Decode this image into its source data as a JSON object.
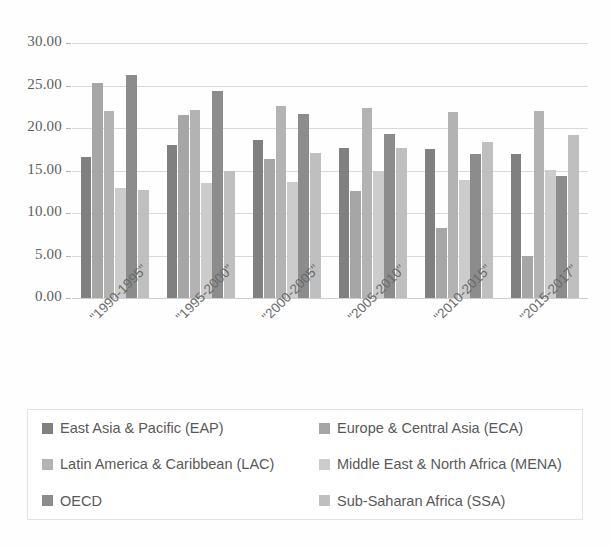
{
  "chart_data": {
    "type": "bar",
    "title": "",
    "subtitle": "",
    "xlabel": "",
    "ylabel": "",
    "ylim": [
      0,
      30
    ],
    "ytick_labels": [
      "0.00",
      "5.00",
      "10.00",
      "15.00",
      "20.00",
      "25.00",
      "30.00"
    ],
    "ytick_values": [
      0,
      5,
      10,
      15,
      20,
      25,
      30
    ],
    "grid": true,
    "legend_position": "bottom",
    "categories": [
      "\"1990-1995\"",
      "\"1995-2000\"",
      "\"2000-2005\"",
      "\"2005-2010\"",
      "\"2010-2015\"",
      "\"2015-2017\""
    ],
    "series": [
      {
        "name": "East Asia & Pacific (EAP)",
        "color": "#808080",
        "values": [
          16.6,
          18.0,
          18.6,
          17.7,
          17.5,
          16.9
        ]
      },
      {
        "name": "Europe & Central Asia (ECA)",
        "color": "#a6a6a6",
        "values": [
          25.3,
          21.5,
          16.3,
          12.6,
          8.2,
          4.9
        ]
      },
      {
        "name": "Latin America & Caribbean (LAC)",
        "color": "#b3b3b3",
        "values": [
          22.0,
          22.1,
          22.6,
          22.3,
          21.9,
          22.0
        ]
      },
      {
        "name": "Middle East & North Africa (MENA)",
        "color": "#cccccc",
        "values": [
          12.9,
          13.5,
          13.6,
          14.9,
          13.9,
          15.1
        ]
      },
      {
        "name": "OECD",
        "color": "#8c8c8c",
        "values": [
          26.2,
          24.4,
          21.6,
          19.3,
          16.9,
          14.4
        ]
      },
      {
        "name": "Sub-Saharan Africa (SSA)",
        "color": "#bfbfbf",
        "values": [
          12.7,
          14.9,
          17.1,
          17.7,
          18.3,
          19.2
        ]
      }
    ]
  },
  "legend": {
    "items": [
      {
        "label": "East Asia & Pacific (EAP)",
        "color": "#808080",
        "swatch": "legend-swatch-eap"
      },
      {
        "label": "Europe & Central Asia (ECA)",
        "color": "#a6a6a6",
        "swatch": "legend-swatch-eca"
      },
      {
        "label": "Latin America & Caribbean (LAC)",
        "color": "#b3b3b3",
        "swatch": "legend-swatch-lac"
      },
      {
        "label": "Middle East & North Africa (MENA)",
        "color": "#cccccc",
        "swatch": "legend-swatch-mena"
      },
      {
        "label": "OECD",
        "color": "#8c8c8c",
        "swatch": "legend-swatch-oecd"
      },
      {
        "label": "Sub-Saharan Africa (SSA)",
        "color": "#bfbfbf",
        "swatch": "legend-swatch-ssa"
      }
    ]
  },
  "colors": {
    "gridline": "#d9d9d9",
    "axis_text": "#5d5d5d",
    "legend_text": "#595959",
    "legend_border": "#e2e2e2",
    "background": "#ffffff"
  }
}
